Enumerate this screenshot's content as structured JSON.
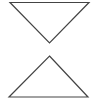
{
  "control": {
    "type": "sort-toggle",
    "stroke_color": "#444444",
    "background": "#ffffff",
    "buttons": [
      {
        "id": "down",
        "icon": "triangle-down-outline-icon"
      },
      {
        "id": "up",
        "icon": "triangle-up-outline-icon"
      }
    ]
  }
}
